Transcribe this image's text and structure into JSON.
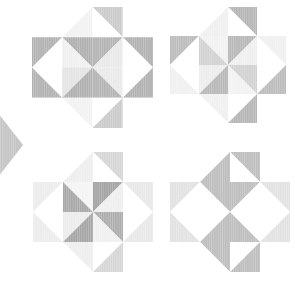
{
  "canvas": {
    "width": 295,
    "height": 290,
    "background": "#ffffff",
    "title": "Four-star quilt block pattern"
  },
  "palette": {
    "white": "#ffffff",
    "near_white": "#fbfbfb",
    "lightest": "#f4f4f4",
    "lighter": "#eeeeee",
    "light": "#e6e6e6",
    "light_mid": "#dcdcdc",
    "mid": "#cfcfcf",
    "mid_dark": "#c2c2c2",
    "gray": "#b4b4b4",
    "dark_gray": "#a8a8a8",
    "darkest": "#9e9e9e"
  },
  "texture": {
    "name": "vertical-pinstripe",
    "stripe_color": "#ffffff",
    "stripe_opacity": 0.28,
    "stripe_width": 0.6,
    "stripe_gap": 1.6
  },
  "blocks": [
    {
      "id": "star-top-left",
      "label": "Star block top-left",
      "x": 32,
      "y": 7,
      "size": 121,
      "cells": [
        {
          "r": 0,
          "c": 0,
          "a": "#ffffff",
          "b": "#ffffff",
          "split": "tl-br"
        },
        {
          "r": 0,
          "c": 1,
          "a": "#ffffff",
          "b": "#f2f2f2",
          "split": "tr-bl"
        },
        {
          "r": 0,
          "c": 2,
          "a": "#cbcbcb",
          "b": "#ffffff",
          "split": "tl-br"
        },
        {
          "r": 0,
          "c": 3,
          "a": "#ffffff",
          "b": "#ffffff",
          "split": "tr-bl"
        },
        {
          "r": 1,
          "c": 0,
          "a": "#b2b2b2",
          "b": "#ffffff",
          "split": "tr-bl"
        },
        {
          "r": 1,
          "c": 1,
          "a": "#b0b0b0",
          "b": "#f0f0f0",
          "split": "tl-br"
        },
        {
          "r": 1,
          "c": 2,
          "a": "#b4b4b4",
          "b": "#e9e9e9",
          "split": "tr-bl"
        },
        {
          "r": 1,
          "c": 3,
          "a": "#b2b2b2",
          "b": "#ffffff",
          "split": "tl-br"
        },
        {
          "r": 2,
          "c": 0,
          "a": "#ffffff",
          "b": "#b2b2b2",
          "split": "tl-br"
        },
        {
          "r": 2,
          "c": 1,
          "a": "#e4e4e4",
          "b": "#b0b0b0",
          "split": "tr-bl"
        },
        {
          "r": 2,
          "c": 2,
          "a": "#eaeaea",
          "b": "#b4b4b4",
          "split": "tl-br"
        },
        {
          "r": 2,
          "c": 3,
          "a": "#ffffff",
          "b": "#b2b2b2",
          "split": "tr-bl"
        },
        {
          "r": 3,
          "c": 0,
          "a": "#ffffff",
          "b": "#ffffff",
          "split": "tr-bl"
        },
        {
          "r": 3,
          "c": 1,
          "a": "#f2f2f2",
          "b": "#ffffff",
          "split": "tl-br"
        },
        {
          "r": 3,
          "c": 2,
          "a": "#ffffff",
          "b": "#cbcbcb",
          "split": "tr-bl"
        },
        {
          "r": 3,
          "c": 3,
          "a": "#ffffff",
          "b": "#ffffff",
          "split": "tl-br"
        }
      ]
    },
    {
      "id": "star-top-right",
      "label": "Star block top-right",
      "x": 170,
      "y": 7,
      "size": 116,
      "cells": [
        {
          "r": 0,
          "c": 0,
          "a": "#ffffff",
          "b": "#ffffff",
          "split": "tl-br"
        },
        {
          "r": 0,
          "c": 1,
          "a": "#ffffff",
          "b": "#f0f0f0",
          "split": "tr-bl"
        },
        {
          "r": 0,
          "c": 2,
          "a": "#b6b6b6",
          "b": "#ffffff",
          "split": "tl-br"
        },
        {
          "r": 0,
          "c": 3,
          "a": "#ffffff",
          "b": "#ffffff",
          "split": "tr-bl"
        },
        {
          "r": 1,
          "c": 0,
          "a": "#bcbcbc",
          "b": "#ffffff",
          "split": "tr-bl"
        },
        {
          "r": 1,
          "c": 1,
          "a": "#f2f2f2",
          "b": "#d2d2d2",
          "split": "tl-br"
        },
        {
          "r": 1,
          "c": 2,
          "a": "#b8b8b8",
          "b": "#efefef",
          "split": "tr-bl"
        },
        {
          "r": 1,
          "c": 3,
          "a": "#f0f0f0",
          "b": "#ffffff",
          "split": "tl-br"
        },
        {
          "r": 2,
          "c": 0,
          "a": "#ffffff",
          "b": "#f0f0f0",
          "split": "tl-br"
        },
        {
          "r": 2,
          "c": 1,
          "a": "#ededed",
          "b": "#b8b8b8",
          "split": "tr-bl"
        },
        {
          "r": 2,
          "c": 2,
          "a": "#d2d2d2",
          "b": "#f2f2f2",
          "split": "tl-br"
        },
        {
          "r": 2,
          "c": 3,
          "a": "#ffffff",
          "b": "#bcbcbc",
          "split": "tr-bl"
        },
        {
          "r": 3,
          "c": 0,
          "a": "#ffffff",
          "b": "#ffffff",
          "split": "tr-bl"
        },
        {
          "r": 3,
          "c": 1,
          "a": "#f0f0f0",
          "b": "#ffffff",
          "split": "tl-br"
        },
        {
          "r": 3,
          "c": 2,
          "a": "#ffffff",
          "b": "#b6b6b6",
          "split": "tr-bl"
        },
        {
          "r": 3,
          "c": 3,
          "a": "#ffffff",
          "b": "#ffffff",
          "split": "tl-br"
        }
      ]
    },
    {
      "id": "star-bottom-left",
      "label": "Star block bottom-left",
      "x": 33,
      "y": 152,
      "size": 120,
      "cells": [
        {
          "r": 0,
          "c": 0,
          "a": "#ffffff",
          "b": "#ffffff",
          "split": "tl-br"
        },
        {
          "r": 0,
          "c": 1,
          "a": "#ffffff",
          "b": "#eeeeee",
          "split": "tr-bl"
        },
        {
          "r": 0,
          "c": 2,
          "a": "#d6d6d6",
          "b": "#ffffff",
          "split": "tl-br"
        },
        {
          "r": 0,
          "c": 3,
          "a": "#ffffff",
          "b": "#ffffff",
          "split": "tr-bl"
        },
        {
          "r": 1,
          "c": 0,
          "a": "#ececec",
          "b": "#ffffff",
          "split": "tr-bl"
        },
        {
          "r": 1,
          "c": 1,
          "a": "#f4f4f4",
          "b": "#a8a8a8",
          "split": "tl-br"
        },
        {
          "r": 1,
          "c": 2,
          "a": "#a4a4a4",
          "b": "#efefef",
          "split": "tr-bl"
        },
        {
          "r": 1,
          "c": 3,
          "a": "#e8e8e8",
          "b": "#ffffff",
          "split": "tl-br"
        },
        {
          "r": 2,
          "c": 0,
          "a": "#ffffff",
          "b": "#ececec",
          "split": "tl-br"
        },
        {
          "r": 2,
          "c": 1,
          "a": "#ececec",
          "b": "#a6a6a6",
          "split": "tr-bl"
        },
        {
          "r": 2,
          "c": 2,
          "a": "#aeaeae",
          "b": "#f0f0f0",
          "split": "tl-br"
        },
        {
          "r": 2,
          "c": 3,
          "a": "#ffffff",
          "b": "#e8e8e8",
          "split": "tr-bl"
        },
        {
          "r": 3,
          "c": 0,
          "a": "#ffffff",
          "b": "#ffffff",
          "split": "tr-bl"
        },
        {
          "r": 3,
          "c": 1,
          "a": "#eeeeee",
          "b": "#ffffff",
          "split": "tl-br"
        },
        {
          "r": 3,
          "c": 2,
          "a": "#ffffff",
          "b": "#d6d6d6",
          "split": "tr-bl"
        },
        {
          "r": 3,
          "c": 3,
          "a": "#ffffff",
          "b": "#ffffff",
          "split": "tl-br"
        }
      ]
    },
    {
      "id": "star-bottom-right",
      "label": "Star block bottom-right",
      "x": 170,
      "y": 152,
      "size": 120,
      "cells": [
        {
          "r": 0,
          "c": 0,
          "a": "#ffffff",
          "b": "#ffffff",
          "split": "tl-br"
        },
        {
          "r": 0,
          "c": 1,
          "a": "#ffffff",
          "b": "#bebebe",
          "split": "tr-bl"
        },
        {
          "r": 0,
          "c": 2,
          "a": "#bebebe",
          "b": "#ffffff",
          "split": "tl-br"
        },
        {
          "r": 0,
          "c": 3,
          "a": "#ffffff",
          "b": "#ffffff",
          "split": "tr-bl"
        },
        {
          "r": 1,
          "c": 0,
          "a": "#e2e2e2",
          "b": "#ffffff",
          "split": "tr-bl"
        },
        {
          "r": 1,
          "c": 1,
          "a": "#bebebe",
          "b": "#ffffff",
          "split": "tl-br"
        },
        {
          "r": 1,
          "c": 2,
          "a": "#bebebe",
          "b": "#ffffff",
          "split": "tr-bl"
        },
        {
          "r": 1,
          "c": 3,
          "a": "#e2e2e2",
          "b": "#ffffff",
          "split": "tl-br"
        },
        {
          "r": 2,
          "c": 0,
          "a": "#ffffff",
          "b": "#e2e2e2",
          "split": "tl-br"
        },
        {
          "r": 2,
          "c": 1,
          "a": "#ffffff",
          "b": "#bebebe",
          "split": "tr-bl"
        },
        {
          "r": 2,
          "c": 2,
          "a": "#ffffff",
          "b": "#bebebe",
          "split": "tl-br"
        },
        {
          "r": 2,
          "c": 3,
          "a": "#ffffff",
          "b": "#e2e2e2",
          "split": "tr-bl"
        },
        {
          "r": 3,
          "c": 0,
          "a": "#ffffff",
          "b": "#ffffff",
          "split": "tr-bl"
        },
        {
          "r": 3,
          "c": 1,
          "a": "#bebebe",
          "b": "#ffffff",
          "split": "tl-br"
        },
        {
          "r": 3,
          "c": 2,
          "a": "#ffffff",
          "b": "#bebebe",
          "split": "tr-bl"
        },
        {
          "r": 3,
          "c": 3,
          "a": "#ffffff",
          "b": "#ffffff",
          "split": "tl-br"
        }
      ]
    }
  ],
  "edge_shape": {
    "id": "partial-diamond-left",
    "label": "Partial diamond cropped at left edge",
    "color": "#c4c4c4",
    "points": "-30,113 -2,113 23,145 -2,177 -30,177"
  }
}
